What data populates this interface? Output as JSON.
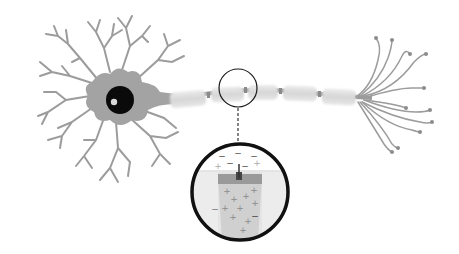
{
  "diagram": {
    "parts": [
      {
        "id": "soma",
        "label": "cell body"
      },
      {
        "id": "nucleus",
        "label": "nucleus"
      },
      {
        "id": "dendrites",
        "label": "dendrites"
      },
      {
        "id": "axon",
        "label": "myelinated axon"
      },
      {
        "id": "axon-terminals",
        "label": "axon terminals"
      },
      {
        "id": "magnifier",
        "label": "node of Ranvier detail"
      }
    ],
    "colors": {
      "background": "#ffffff",
      "soma": "#a3a3a3",
      "dendrite": "#9c9c9c",
      "nucleus": "#0a0a0a",
      "nucleolus": "#d8d8d8",
      "myelin": "#dcdcdc",
      "node": "#8a8a8a",
      "magnifier_ring": "#111111",
      "sign_color": "#9a9a9a",
      "minus_color": "#555555"
    },
    "myelin_segment_count": 6,
    "terminal_count": 11,
    "magnified_view": {
      "outside_charges": [
        "−",
        "−",
        "−",
        "+",
        "−",
        "−",
        "+"
      ],
      "inside_charges": [
        "+",
        "+",
        "+",
        "+",
        "+",
        "+",
        "+",
        "+",
        "+",
        "+",
        "−",
        "−"
      ]
    }
  }
}
